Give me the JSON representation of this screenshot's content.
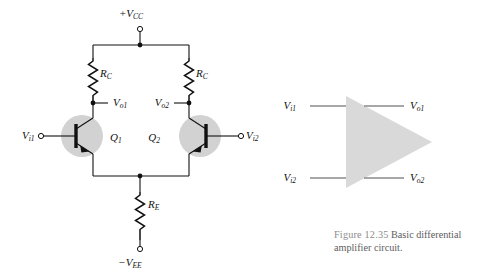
{
  "figure": {
    "number": "Figure 12.35",
    "caption": "Basic differential amplifier circuit.",
    "caption_line1": "Basic differential",
    "caption_line2": "amplifier circuit."
  },
  "colors": {
    "wire": "#111111",
    "transistor_halo": "#d2d2d2",
    "triangle_fill": "#d9d9d9",
    "caption_number": "#8c8c8c",
    "caption_text": "#5d5d5d",
    "background": "#ffffff"
  },
  "circuit": {
    "supply_positive": {
      "base": "+V",
      "sub": "CC",
      "full": "+VCC"
    },
    "supply_negative": {
      "base": "−V",
      "sub": "EE",
      "full": "−VEE"
    },
    "resistors": [
      {
        "base": "R",
        "sub": "C",
        "full": "RC",
        "position": "left-collector"
      },
      {
        "base": "R",
        "sub": "C",
        "full": "RC",
        "position": "right-collector"
      },
      {
        "base": "R",
        "sub": "E",
        "full": "RE",
        "position": "common-emitter"
      }
    ],
    "transistors": [
      {
        "base": "Q",
        "sub": "1",
        "full": "Q1",
        "type": "npn",
        "orientation": "right-facing"
      },
      {
        "base": "Q",
        "sub": "2",
        "full": "Q2",
        "type": "npn",
        "orientation": "left-facing"
      }
    ],
    "inputs": [
      {
        "base": "V",
        "sub": "i1",
        "full": "Vi1",
        "position": "left"
      },
      {
        "base": "V",
        "sub": "i2",
        "full": "Vi2",
        "position": "right"
      }
    ],
    "outputs": [
      {
        "base": "V",
        "sub": "o1",
        "full": "Vo1",
        "position": "left-collector"
      },
      {
        "base": "V",
        "sub": "o2",
        "full": "Vo2",
        "position": "right-collector"
      }
    ]
  },
  "block_symbol": {
    "shape": "triangle",
    "inputs": [
      {
        "base": "V",
        "sub": "i1",
        "full": "Vi1"
      },
      {
        "base": "V",
        "sub": "i2",
        "full": "Vi2"
      }
    ],
    "outputs": [
      {
        "base": "V",
        "sub": "o1",
        "full": "Vo1"
      },
      {
        "base": "V",
        "sub": "o2",
        "full": "Vo2"
      }
    ]
  }
}
